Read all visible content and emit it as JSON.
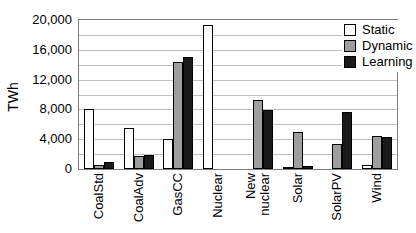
{
  "chart_data": {
    "type": "bar",
    "title": "",
    "xlabel": "",
    "ylabel": "TWh",
    "ylim": [
      0,
      20000
    ],
    "gridline_interval": 2000,
    "grid": true,
    "legend_position": "top-right",
    "ytick_labels": [
      "0",
      "4,000",
      "8,000",
      "12,000",
      "16,000",
      "20,000"
    ],
    "ytick_values": [
      0,
      4000,
      8000,
      12000,
      16000,
      20000
    ],
    "categories": [
      "CoalStd",
      "CoalAdv",
      "GasCC",
      "Nuclear",
      "New\nnuclear",
      "Solar",
      "SolarPV",
      "Wind"
    ],
    "series": [
      {
        "name": "Static",
        "color": "#ffffff",
        "values": [
          8000,
          5500,
          4000,
          19300,
          0,
          300,
          0,
          600
        ]
      },
      {
        "name": "Dynamic",
        "color": "#9e9e9e",
        "values": [
          600,
          1700,
          14300,
          0,
          9200,
          4900,
          3400,
          4400
        ]
      },
      {
        "name": "Learning",
        "color": "#1a1a1a",
        "values": [
          900,
          1900,
          15000,
          0,
          7900,
          400,
          7600,
          4300
        ]
      }
    ],
    "colors": {
      "gridline": "#c0c0c0",
      "plot_border": "#7f7f7f",
      "bar_border": "#000000",
      "text": "#000000",
      "background": "#ffffff"
    }
  }
}
